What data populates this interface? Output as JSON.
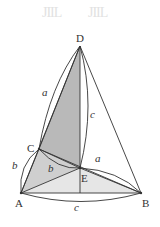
{
  "watermark": [
    "JIIL",
    "JIIL"
  ],
  "points": {
    "D": {
      "label": "D",
      "x": 80,
      "y": 46
    },
    "C": {
      "label": "C",
      "x": 39,
      "y": 149
    },
    "E": {
      "label": "E",
      "x": 80,
      "y": 168
    },
    "A": {
      "label": "A",
      "x": 21,
      "y": 193
    },
    "B": {
      "label": "B",
      "x": 141,
      "y": 193
    }
  },
  "edge_labels": {
    "DC": "a",
    "DE": "c",
    "CA": "b",
    "CE": "b",
    "EB": "a",
    "AB": "c"
  },
  "colors": {
    "shade_dark": "#b9b9b9",
    "shade_light": "#e4e4e4",
    "line": "#333333"
  }
}
